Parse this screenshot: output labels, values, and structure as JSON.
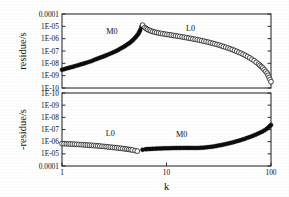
{
  "figure": {
    "background_color": "#ffffff",
    "ink_color": "#101010"
  },
  "axes": {
    "x": {
      "label": "k",
      "scale": "log",
      "min": 1,
      "max": 100,
      "tick_labels": [
        "1",
        "10",
        "100"
      ],
      "tick_values": [
        1,
        10,
        100
      ]
    },
    "top_y": {
      "label": "residue/s",
      "scale": "log",
      "tick_labels": [
        "0.0001",
        "1E-05",
        "1E-06",
        "1E-07",
        "1E-08",
        "1E-09",
        "1E-10"
      ],
      "tick_values": [
        0.0001,
        1e-05,
        1e-06,
        1e-07,
        1e-08,
        1e-09,
        1e-10
      ],
      "direction": "descending-downward"
    },
    "bottom_y": {
      "label": "-residue/s",
      "scale": "log",
      "tick_labels": [
        "1E-10",
        "1E-09",
        "1E-08",
        "1E-07",
        "1E-06",
        "1E-05",
        "0.0001"
      ],
      "tick_values": [
        1e-10,
        1e-09,
        1e-08,
        1e-07,
        1e-06,
        1e-05,
        0.0001
      ],
      "direction": "ascending-downward"
    }
  },
  "annotations": {
    "top_m0": "M0",
    "top_l0": "L0",
    "bottom_l0": "L0",
    "bottom_m0": "M0"
  },
  "chart_data": {
    "type": "line",
    "title": "",
    "xlabel": "k",
    "layout": "two stacked log-log panels sharing a common logarithmic k axis from 1 to 100",
    "panels": [
      {
        "name": "top-panel",
        "ylabel": "residue/s",
        "yscale": "log",
        "ylim": [
          1e-10,
          0.0001
        ],
        "y_axis_order": "0.0001 at top, 1E-10 at bottom",
        "xscale": "log",
        "xlim": [
          1,
          100
        ],
        "grid": false,
        "legend": "inline annotations",
        "series": [
          {
            "name": "M0",
            "marker": "filled-circle",
            "marker_size": 2,
            "points": [
              [
                1.0,
                3e-09
              ],
              [
                1.15,
                4.2e-09
              ],
              [
                1.3,
                5.6e-09
              ],
              [
                1.5,
                8e-09
              ],
              [
                1.7,
                1.1e-08
              ],
              [
                1.9,
                1.5e-08
              ],
              [
                2.1,
                2.1e-08
              ],
              [
                2.4,
                3.2e-08
              ],
              [
                2.7,
                4.8e-08
              ],
              [
                3.0,
                7e-08
              ],
              [
                3.3,
                1e-07
              ],
              [
                3.6,
                1.5e-07
              ],
              [
                3.9,
                2.2e-07
              ],
              [
                4.2,
                3.3e-07
              ],
              [
                4.5,
                5e-07
              ],
              [
                4.8,
                8e-07
              ],
              [
                5.1,
                1.4e-06
              ],
              [
                5.4,
                2.6e-06
              ],
              [
                5.6,
                5e-06
              ],
              [
                5.75,
                9e-06
              ],
              [
                5.85,
                1.2e-05
              ]
            ]
          },
          {
            "name": "L0",
            "marker": "open-circle",
            "marker_size": 2.4,
            "points": [
              [
                5.9,
                1.25e-05
              ],
              [
                6.2,
                8e-06
              ],
              [
                6.6,
                5.5e-06
              ],
              [
                7.1,
                4.2e-06
              ],
              [
                7.7,
                3.4e-06
              ],
              [
                8.4,
                2.9e-06
              ],
              [
                9.2,
                2.5e-06
              ],
              [
                10.1,
                2.2e-06
              ],
              [
                11.1,
                1.95e-06
              ],
              [
                12.2,
                1.7e-06
              ],
              [
                13.4,
                1.5e-06
              ],
              [
                14.8,
                1.3e-06
              ],
              [
                16.3,
                1.12e-06
              ],
              [
                17.9,
                9.6e-07
              ],
              [
                19.7,
                8.2e-07
              ],
              [
                21.7,
                6.9e-07
              ],
              [
                23.9,
                5.7e-07
              ],
              [
                26.3,
                4.7e-07
              ],
              [
                29.0,
                3.8e-07
              ],
              [
                31.9,
                3e-07
              ],
              [
                35.1,
                2.3e-07
              ],
              [
                38.7,
                1.75e-07
              ],
              [
                42.6,
                1.3e-07
              ],
              [
                46.9,
                9.4e-08
              ],
              [
                51.6,
                6.6e-08
              ],
              [
                56.8,
                4.4e-08
              ],
              [
                62.6,
                2.8e-08
              ],
              [
                68.9,
                1.65e-08
              ],
              [
                75.9,
                8.8e-09
              ],
              [
                83.5,
                4.2e-09
              ],
              [
                91.9,
                1.6e-09
              ],
              [
                100.0,
                3.2e-10
              ]
            ]
          }
        ]
      },
      {
        "name": "bottom-panel",
        "ylabel": "-residue/s",
        "yscale": "log",
        "ylim": [
          1e-10,
          0.0001
        ],
        "y_axis_order": "1E-10 at top, 0.0001 at bottom (inverted)",
        "xscale": "log",
        "xlim": [
          1,
          100
        ],
        "grid": false,
        "legend": "inline annotations",
        "series": [
          {
            "name": "L0",
            "marker": "open-circle",
            "marker_size": 2.4,
            "points": [
              [
                1.0,
                1.45e-06
              ],
              [
                1.1,
                1.5e-06
              ],
              [
                1.2,
                1.55e-06
              ],
              [
                1.32,
                1.62e-06
              ],
              [
                1.45,
                1.7e-06
              ],
              [
                1.6,
                1.8e-06
              ],
              [
                1.75,
                1.9e-06
              ],
              [
                1.92,
                2e-06
              ],
              [
                2.1,
                2.15e-06
              ],
              [
                2.3,
                2.3e-06
              ],
              [
                2.53,
                2.5e-06
              ],
              [
                2.77,
                2.7e-06
              ],
              [
                3.04,
                2.95e-06
              ],
              [
                3.33,
                3.2e-06
              ],
              [
                3.65,
                3.5e-06
              ],
              [
                4.0,
                3.9e-06
              ],
              [
                4.35,
                4.3e-06
              ],
              [
                4.7,
                4.8e-06
              ],
              [
                5.0,
                5.4e-06
              ],
              [
                5.25,
                6e-06
              ]
            ]
          },
          {
            "name": "M0",
            "marker": "filled-circle",
            "marker_size": 2,
            "points": [
              [
                5.9,
                4.6e-06
              ],
              [
                6.3,
                4.2e-06
              ],
              [
                6.8,
                4e-06
              ],
              [
                7.4,
                3.85e-06
              ],
              [
                8.1,
                3.7e-06
              ],
              [
                8.9,
                3.6e-06
              ],
              [
                9.8,
                3.5e-06
              ],
              [
                10.8,
                3.42e-06
              ],
              [
                11.9,
                3.35e-06
              ],
              [
                13.1,
                3.3e-06
              ],
              [
                14.4,
                3.28e-06
              ],
              [
                15.9,
                3.26e-06
              ],
              [
                17.5,
                3.26e-06
              ],
              [
                19.3,
                3.3e-06
              ],
              [
                21.3,
                3.2e-06
              ],
              [
                23.4,
                3e-06
              ],
              [
                25.8,
                2.75e-06
              ],
              [
                28.4,
                2.45e-06
              ],
              [
                31.3,
                2.1e-06
              ],
              [
                34.4,
                1.8e-06
              ],
              [
                37.9,
                1.5e-06
              ],
              [
                41.8,
                1.22e-06
              ],
              [
                46.0,
                9.8e-07
              ],
              [
                50.7,
                7.7e-07
              ],
              [
                55.8,
                5.9e-07
              ],
              [
                61.5,
                4.4e-07
              ],
              [
                67.7,
                3.2e-07
              ],
              [
                74.6,
                2.25e-07
              ],
              [
                82.2,
                1.5e-07
              ],
              [
                90.5,
                9.3e-08
              ],
              [
                100.0,
                4.2e-08
              ]
            ]
          }
        ]
      }
    ]
  }
}
